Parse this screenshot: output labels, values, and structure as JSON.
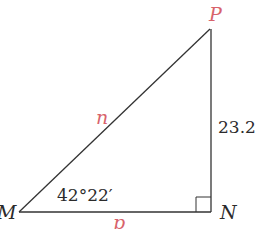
{
  "diagram": {
    "type": "right-triangle",
    "vertices": {
      "P": {
        "label": "P",
        "x": 210,
        "y": 29,
        "color": "#d8636b"
      },
      "M": {
        "label": "M",
        "x": 19,
        "y": 212,
        "color": "#2b2b2b"
      },
      "N": {
        "label": "N",
        "x": 211,
        "y": 212,
        "color": "#2b2b2b"
      }
    },
    "sides": {
      "hypotenuse": {
        "label": "n",
        "from": "M",
        "to": "P",
        "color": "#d8636b"
      },
      "vertical": {
        "label": "23.2",
        "from": "N",
        "to": "P",
        "color": "#2b2b2b"
      },
      "base": {
        "label": "p",
        "from": "M",
        "to": "N",
        "color": "#d8636b"
      }
    },
    "angle_M": {
      "label": "42°22′"
    },
    "right_angle_at": "N",
    "line_color": "#333333"
  }
}
